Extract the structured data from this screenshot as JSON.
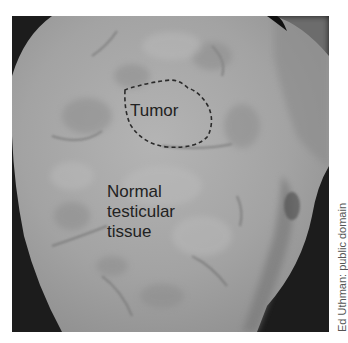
{
  "figure": {
    "labels": {
      "tumor": "Tumor",
      "normal_line1": "Normal",
      "normal_line2": "testicular",
      "normal_line3": "tissue"
    },
    "credit": "Ed Uthman: public domain"
  },
  "colors": {
    "background": "#ffffff",
    "photo_dark": "#1c1c1c",
    "tissue": "#a6a6a6",
    "tumor_outline": "#2a2a2a",
    "label_text": "#222222",
    "credit_text": "#555555"
  }
}
